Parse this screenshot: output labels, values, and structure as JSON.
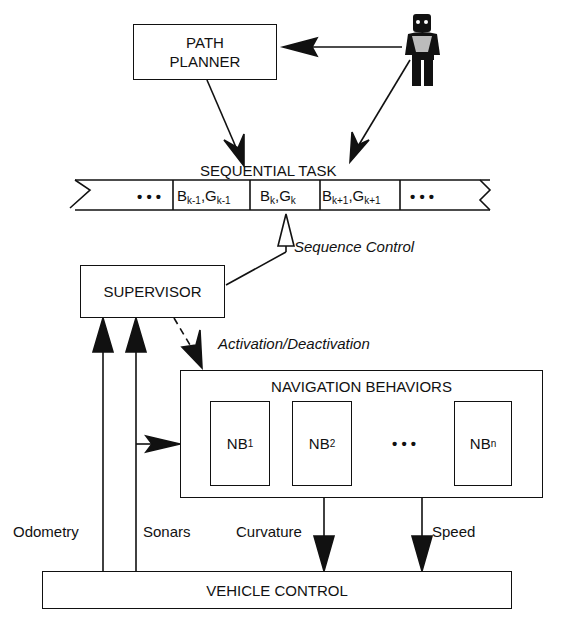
{
  "diagram": {
    "path_planner": {
      "line1": "PATH",
      "line2": "PLANNER"
    },
    "sequential_task": {
      "title": "SEQUENTIAL TASK",
      "ellipsis_left": "• • •",
      "ellipsis_right": "• • •",
      "cells": [
        {
          "b": "B",
          "b_sub": "k-1",
          "g": "G",
          "g_sub": "k-1"
        },
        {
          "b": "B",
          "b_sub": "k",
          "g": "G",
          "g_sub": "k"
        },
        {
          "b": "B",
          "b_sub": "k+1",
          "g": "G",
          "g_sub": "k+1"
        }
      ]
    },
    "sequence_control": "Sequence Control",
    "supervisor": "SUPERVISOR",
    "activation": "Activation/Deactivation",
    "navigation_behaviors": {
      "title": "NAVIGATION BEHAVIORS",
      "items": [
        {
          "label": "NB",
          "sub": "1"
        },
        {
          "label": "NB",
          "sub": "2"
        },
        {
          "label": "NB",
          "sub": "n"
        }
      ],
      "ellipsis": "• • •"
    },
    "signals": {
      "odometry": "Odometry",
      "sonars": "Sonars",
      "curvature": "Curvature",
      "speed": "Speed"
    },
    "vehicle_control": "VEHICLE CONTROL",
    "user_icon": "person-icon"
  }
}
